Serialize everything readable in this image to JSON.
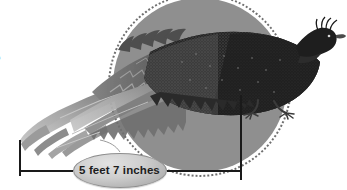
{
  "figure": {
    "background_color": "#ffffff",
    "edge_glyph": "5",
    "highlight": {
      "name": "gray-circle-highlight",
      "fill_color": "#8f8f8f",
      "ring_color": "#6f6f6f",
      "center_x": 200,
      "center_y": 85,
      "radius": 87
    },
    "measurement": {
      "label": "5 feet 7 inches",
      "value": 5,
      "unit_major": "feet",
      "value_minor": 7,
      "unit_minor": "inches",
      "line_color": "#1a1a1a",
      "left_tick_x": 19,
      "right_tick_x": 240,
      "baseline_y": 170
    },
    "bird_colors": {
      "body_dark": "#2b2b2b",
      "body_mid": "#4a4a4a",
      "tail_light": "#b9b9b9",
      "tail_mid": "#8d8d8d",
      "tail_dark": "#6a6a6a",
      "head_dark": "#1e1e1e",
      "leg": "#3a3a3a"
    }
  }
}
